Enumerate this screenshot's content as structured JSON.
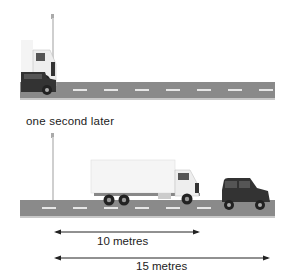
{
  "scene_top": {
    "description": "Car and truck side by side at the lamppost"
  },
  "caption": "one second later",
  "scene_bottom": {
    "description": "Truck and car after one second"
  },
  "measurements": [
    {
      "label": "10 metres",
      "value": 10,
      "unit": "metres"
    },
    {
      "label": "15 metres",
      "value": 15,
      "unit": "metres"
    }
  ],
  "colors": {
    "road": "#8a8a8a",
    "lane_marking": "#e6e6e6",
    "truck_body": "#f2f2f2",
    "car_body": "#3a3a3a"
  }
}
